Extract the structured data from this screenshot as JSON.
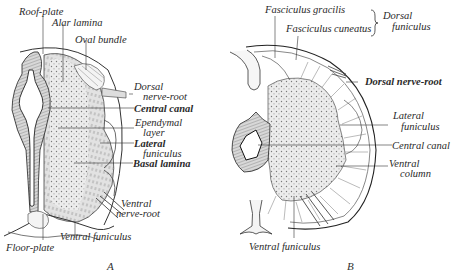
{
  "figure_a": {
    "caption": "A",
    "labels": {
      "roof_plate": "Roof-plate",
      "alar_lamina": "Alar lamina",
      "oval_bundle": "Oval bundle",
      "dorsal_nerve_root_1": "Dorsal",
      "dorsal_nerve_root_2": "nerve-root",
      "central_canal": "Central canal",
      "ependymal_layer_1": "Ependymal",
      "ependymal_layer_2": "layer",
      "lateral_funiculus_1": "Lateral",
      "lateral_funiculus_2": "funiculus",
      "basal_lamina": "Basal lamina",
      "ventral_nerve_root_1": "Ventral",
      "ventral_nerve_root_2": "nerve-root",
      "ventral_funiculus": "Ventral funiculus",
      "floor_plate": "Floor-plate"
    }
  },
  "figure_b": {
    "caption": "B",
    "labels": {
      "fasciculus_gracilis": "Fasciculus gracilis",
      "fasciculus_cuneatus": "Fasciculus cuneatus",
      "dorsal_funiculus_1": "Dorsal",
      "dorsal_funiculus_2": "funiculus",
      "dorsal_nerve_root": "Dorsal nerve-root",
      "lateral_funiculus_1": "Lateral",
      "lateral_funiculus_2": "funiculus",
      "central_canal": "Central canal",
      "ventral_column_1": "Ventral",
      "ventral_column_2": "column",
      "ventral_funiculus": "Ventral funiculus"
    }
  },
  "colors": {
    "ink": "#2a2a2a",
    "stipple": "#8a8a8a",
    "fill": "#e6e6e6",
    "background": "#ffffff"
  }
}
